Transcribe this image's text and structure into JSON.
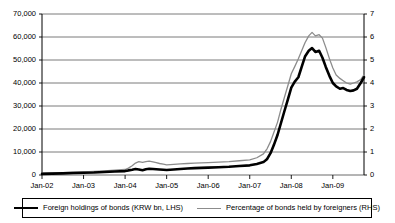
{
  "chart_data": {
    "type": "line",
    "title": "",
    "subtitle": "",
    "xlabel": "",
    "ylabel": "",
    "grid": true,
    "legend_position": "bottom",
    "x_tick_labels": [
      "Jan-02",
      "Jan-03",
      "Jan-04",
      "Jan-05",
      "Jan-06",
      "Jan-07",
      "Jan-08",
      "Jan-09"
    ],
    "x_tick_values": [
      2002.0,
      2003.0,
      2004.0,
      2005.0,
      2006.0,
      2007.0,
      2008.0,
      2009.0
    ],
    "xlim": [
      2002.0,
      2009.75
    ],
    "left_axis": {
      "label": "Foreign holdings of bonds (KRW bn, LHS)",
      "ylim": [
        0,
        70000
      ],
      "tick_values": [
        0,
        10000,
        20000,
        30000,
        40000,
        50000,
        60000,
        70000
      ],
      "tick_labels": [
        "0",
        "10,000",
        "20,000",
        "30,000",
        "40,000",
        "50,000",
        "60,000",
        "70,000"
      ]
    },
    "right_axis": {
      "label": "Percentage of bonds held by foreigners (RHS)",
      "ylim": [
        0,
        7
      ],
      "tick_values": [
        0,
        1,
        2,
        3,
        4,
        5,
        6,
        7
      ],
      "tick_labels": [
        "0",
        "1",
        "2",
        "3",
        "4",
        "5",
        "6",
        "7"
      ]
    },
    "series": [
      {
        "name": "Foreign holdings of bonds (KRW bn, LHS)",
        "axis": "left",
        "color": "#000000",
        "width": 2.6,
        "x": [
          2002.0,
          2002.25,
          2002.5,
          2002.75,
          2003.0,
          2003.25,
          2003.5,
          2003.75,
          2004.0,
          2004.08,
          2004.17,
          2004.25,
          2004.33,
          2004.42,
          2004.5,
          2004.58,
          2004.67,
          2004.75,
          2004.83,
          2004.92,
          2005.0,
          2005.17,
          2005.33,
          2005.5,
          2005.67,
          2005.83,
          2006.0,
          2006.25,
          2006.5,
          2006.75,
          2007.0,
          2007.17,
          2007.33,
          2007.42,
          2007.5,
          2007.58,
          2007.67,
          2007.75,
          2007.83,
          2007.92,
          2008.0,
          2008.08,
          2008.17,
          2008.25,
          2008.33,
          2008.42,
          2008.5,
          2008.58,
          2008.67,
          2008.75,
          2008.83,
          2008.92,
          2009.0,
          2009.08,
          2009.17,
          2009.25,
          2009.33,
          2009.42,
          2009.5,
          2009.58,
          2009.67,
          2009.75
        ],
        "values": [
          500,
          600,
          700,
          900,
          1000,
          1100,
          1300,
          1500,
          1700,
          2000,
          2300,
          2600,
          2400,
          2100,
          2500,
          2700,
          2600,
          2500,
          2400,
          2300,
          2200,
          2400,
          2600,
          2800,
          3000,
          3100,
          3200,
          3400,
          3600,
          3900,
          4200,
          4800,
          5600,
          7000,
          9500,
          13000,
          17500,
          22500,
          27500,
          33000,
          38000,
          40500,
          42500,
          47000,
          51500,
          54000,
          55200,
          53500,
          54000,
          51000,
          47000,
          43000,
          40000,
          38500,
          37500,
          37800,
          37000,
          36500,
          36800,
          37500,
          40000,
          42500
        ]
      },
      {
        "name": "Percentage of bonds held by foreigners (RHS)",
        "axis": "right",
        "color": "#8c8c8c",
        "width": 1.3,
        "x": [
          2002.0,
          2002.25,
          2002.5,
          2002.75,
          2003.0,
          2003.25,
          2003.5,
          2003.75,
          2004.0,
          2004.08,
          2004.17,
          2004.25,
          2004.33,
          2004.42,
          2004.5,
          2004.58,
          2004.67,
          2004.75,
          2004.83,
          2004.92,
          2005.0,
          2005.17,
          2005.33,
          2005.5,
          2005.67,
          2005.83,
          2006.0,
          2006.25,
          2006.5,
          2006.75,
          2007.0,
          2007.17,
          2007.33,
          2007.42,
          2007.5,
          2007.58,
          2007.67,
          2007.75,
          2007.83,
          2007.92,
          2008.0,
          2008.08,
          2008.17,
          2008.25,
          2008.33,
          2008.42,
          2008.5,
          2008.58,
          2008.67,
          2008.75,
          2008.83,
          2008.92,
          2009.0,
          2009.08,
          2009.17,
          2009.25,
          2009.33,
          2009.42,
          2009.5,
          2009.58,
          2009.67,
          2009.75
        ],
        "values": [
          0.08,
          0.09,
          0.1,
          0.12,
          0.14,
          0.16,
          0.18,
          0.21,
          0.24,
          0.3,
          0.4,
          0.52,
          0.58,
          0.55,
          0.58,
          0.6,
          0.57,
          0.54,
          0.5,
          0.47,
          0.44,
          0.46,
          0.48,
          0.5,
          0.52,
          0.53,
          0.54,
          0.56,
          0.58,
          0.62,
          0.66,
          0.75,
          0.92,
          1.15,
          1.45,
          1.85,
          2.3,
          2.85,
          3.35,
          3.9,
          4.4,
          4.7,
          5.05,
          5.4,
          5.75,
          6.05,
          6.2,
          6.05,
          6.1,
          5.95,
          5.55,
          5.05,
          4.65,
          4.35,
          4.2,
          4.1,
          4.0,
          3.95,
          4.0,
          4.05,
          4.15,
          4.35
        ]
      }
    ]
  },
  "legend": {
    "entries": [
      {
        "label": "Foreign holdings of bonds (KRW bn, LHS)",
        "swatch": "series-black"
      },
      {
        "label": "Percentage of bonds held by foreigners (RHS)",
        "swatch": "series-gray"
      }
    ]
  },
  "colors": {
    "series_black": "#000000",
    "series_gray": "#8c8c8c",
    "gridline": "#595959",
    "axis": "#000000",
    "background": "#ffffff"
  }
}
